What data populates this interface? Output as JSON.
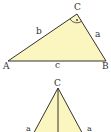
{
  "diagram": {
    "triangle1": {
      "vertices": {
        "A": "A",
        "B": "B",
        "C": "C"
      },
      "sides": {
        "a": "a",
        "b": "b",
        "c": "c"
      },
      "right_angle_at": "C",
      "fill": "#fbf5c0",
      "stroke": "#333333"
    },
    "triangle2": {
      "apex": "C",
      "sides": {
        "left": "a",
        "right": "a"
      },
      "has_altitude": true,
      "fill": "#fbf5c0",
      "stroke": "#333333"
    }
  }
}
